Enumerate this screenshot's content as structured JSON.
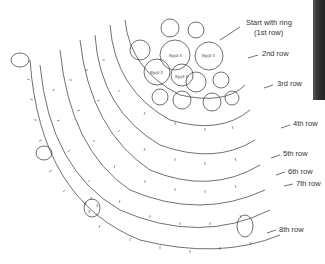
{
  "diagram": {
    "type": "tatting-doily-pattern",
    "annotations": [
      {
        "id": "start",
        "line1": "Start with ring",
        "line2": "(1st row)",
        "x": 246,
        "y": 22
      },
      {
        "id": "row2",
        "text": "2nd row",
        "x": 262,
        "y": 52
      },
      {
        "id": "row3",
        "text": "3rd row",
        "x": 277,
        "y": 82
      },
      {
        "id": "row4",
        "text": "4th row",
        "x": 293,
        "y": 122
      },
      {
        "id": "row5",
        "text": "5th row",
        "x": 283,
        "y": 152
      },
      {
        "id": "row6",
        "text": "6th row",
        "x": 288,
        "y": 170
      },
      {
        "id": "row7",
        "text": "7th row",
        "x": 296,
        "y": 182
      },
      {
        "id": "row8",
        "text": "8th row",
        "x": 279,
        "y": 228
      }
    ],
    "ring_labels": [
      "8(p)4:3",
      "8(p)4:3",
      "8(p)4:3",
      "8(p)4:3"
    ],
    "stitch_counts": [
      "3",
      "3",
      "3",
      "3"
    ],
    "colors": {
      "line": "#333333",
      "background": "#ffffff",
      "edge_strip": "#2a2a2a"
    }
  }
}
